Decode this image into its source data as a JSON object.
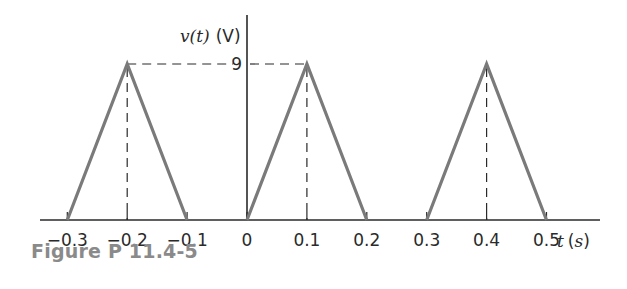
{
  "caption": "Figure P 11.4-5",
  "chart_data": {
    "type": "line",
    "title": "",
    "xlabel": "t (s)",
    "ylabel": "v(t) (V)",
    "xlim": [
      -0.35,
      0.55
    ],
    "ylim": [
      0,
      10
    ],
    "grid": false,
    "legend": "none",
    "x_tick_labels": [
      "-0.3",
      "-0.2",
      "-0.1",
      "0",
      "0.1",
      "0.2",
      "0.3",
      "0.4",
      "0.5"
    ],
    "y_tick_labels": [
      "9"
    ],
    "series": [
      {
        "name": "pulse 1",
        "x": [
          -0.3,
          -0.2,
          -0.1
        ],
        "y": [
          0,
          9,
          0
        ]
      },
      {
        "name": "pulse 2",
        "x": [
          0,
          0.1,
          0.2
        ],
        "y": [
          0,
          9,
          0
        ]
      },
      {
        "name": "pulse 3",
        "x": [
          0.3,
          0.4,
          0.5
        ],
        "y": [
          0,
          9,
          0
        ]
      }
    ],
    "annotations": [
      "dashed guide lines from peaks at t=-0.2 and t=0.1 to the value 9 on the v-axis",
      "dashed vertical lines from each peak to the t-axis"
    ],
    "line_color": "#7a7a7a",
    "axis_color": "#2a2a2a"
  }
}
